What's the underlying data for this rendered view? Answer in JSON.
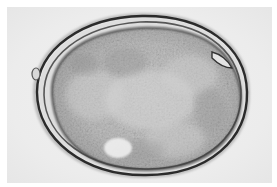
{
  "image": {
    "subject": "microscopy image of an oval egg with thick shell and granular contents",
    "palette": {
      "background": "#efefef",
      "shell_dark": "#2a2a2a",
      "shell_mid": "#6b6b6b",
      "contents_base": "#b9b9b9",
      "contents_light": "#d9d9d9",
      "highlight": "#eeeeee"
    }
  }
}
